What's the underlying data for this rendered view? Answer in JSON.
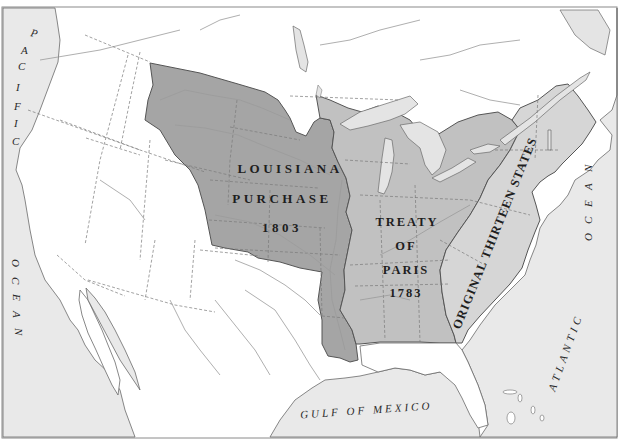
{
  "map": {
    "title": "",
    "regions": [
      {
        "id": "louisiana-purchase",
        "lines": [
          "LOUISIANA",
          "PURCHASE",
          "1803"
        ],
        "fill": "#a5a5a5"
      },
      {
        "id": "treaty-of-paris",
        "lines": [
          "TREATY",
          "OF",
          "PARIS",
          "1783"
        ],
        "fill": "#c1c1c1"
      },
      {
        "id": "original-thirteen-states",
        "lines": [
          "ORIGINAL THIRTEEN STATES"
        ],
        "fill": "#d6d6d6"
      }
    ],
    "water_labels": {
      "pacific_top": "PACIFIC",
      "pacific_bottom": "OCEAN",
      "atlantic_top": "OCEAN",
      "atlantic_bottom": "ATLANTIC",
      "gulf": "GULF OF MEXICO"
    },
    "colors": {
      "water": "#e9e9e9",
      "land_unclaimed": "#ffffff",
      "louisiana": "#a5a5a5",
      "treaty_paris": "#c1c1c1",
      "thirteen": "#d6d6d6",
      "lakes": "#e4e4e4",
      "frame": "#8a8a8a"
    }
  }
}
